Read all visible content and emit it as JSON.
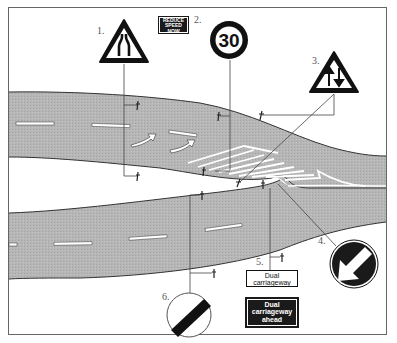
{
  "diagram": {
    "type": "road-sign-layout",
    "colors": {
      "road": "#b4b4b4",
      "road_edge": "#333333",
      "markings": "#ffffff",
      "sign_black": "#1a1a1a",
      "sign_red_ring": "#111111",
      "frame": "#666666"
    },
    "signs": [
      {
        "number": "1.",
        "name": "road-narrows-ahead",
        "shape": "triangle",
        "icon": "road-narrows-icon"
      },
      {
        "number": "2.",
        "name": "speed-limit",
        "shape": "circle",
        "value": "30"
      },
      {
        "number": "3.",
        "name": "two-way-traffic",
        "shape": "triangle",
        "icon": "two-way-arrows-icon"
      },
      {
        "number": "4.",
        "name": "keep-left",
        "shape": "circle",
        "icon": "arrow-down-left-icon"
      },
      {
        "number": "5.",
        "name": "dual-carriageway-plate",
        "shape": "rectangle"
      },
      {
        "number": "6.",
        "name": "national-speed-limit",
        "shape": "circle",
        "icon": "diagonal-bar-icon"
      }
    ],
    "plates": {
      "reduce_speed": {
        "line1": "REDUCE",
        "line2": "SPEED",
        "line3": "NOW"
      },
      "dual_carriageway": {
        "line1": "Dual",
        "line2": "carriageway"
      },
      "dual_carriageway_ahead": {
        "line1": "Dual",
        "line2": "carriageway",
        "line3": "ahead"
      }
    },
    "labels": {
      "n1": "1.",
      "n2": "2.",
      "n3": "3.",
      "n4": "4.",
      "n5": "5.",
      "n6": "6.",
      "speed": "30"
    }
  }
}
